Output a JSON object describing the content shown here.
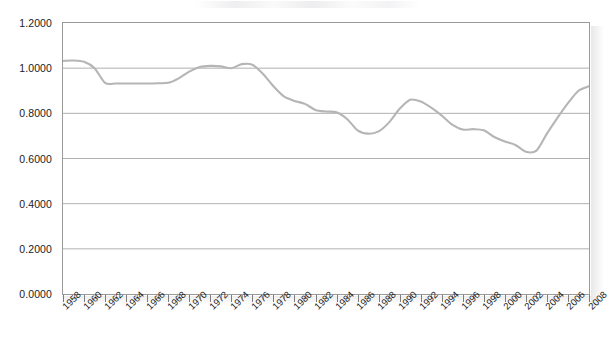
{
  "chart_data": {
    "type": "line",
    "title": "",
    "subtitle": "",
    "xlabel": "",
    "ylabel": "",
    "grid": true,
    "legend": "none",
    "ylim": [
      0.0,
      1.2
    ],
    "xlim": [
      1958,
      2008
    ],
    "ytick_labels": [
      "1.2000",
      "1.0000",
      "0.8000",
      "0.6000",
      "0.4000",
      "0.2000",
      "0.0000"
    ],
    "ytick_values": [
      1.2,
      1.0,
      0.8,
      0.6,
      0.4,
      0.2,
      0.0
    ],
    "xtick_labels": [
      "1958",
      "1960",
      "1962",
      "1964",
      "1966",
      "1968",
      "1970",
      "1972",
      "1974",
      "1976",
      "1978",
      "1980",
      "1982",
      "1984",
      "1986",
      "1988",
      "1990",
      "1992",
      "1994",
      "1996",
      "1998",
      "2000",
      "2002",
      "2004",
      "2006",
      "2008"
    ],
    "series": [
      {
        "name": "series-1",
        "color": "#b5b5b5",
        "x": [
          1958,
          1959,
          1960,
          1961,
          1962,
          1963,
          1964,
          1965,
          1966,
          1967,
          1968,
          1969,
          1970,
          1971,
          1972,
          1973,
          1974,
          1975,
          1976,
          1977,
          1978,
          1979,
          1980,
          1981,
          1982,
          1983,
          1984,
          1985,
          1986,
          1987,
          1988,
          1989,
          1990,
          1991,
          1992,
          1993,
          1994,
          1995,
          1996,
          1997,
          1998,
          1999,
          2000,
          2001,
          2002,
          2003,
          2004,
          2005,
          2006,
          2007,
          2008
        ],
        "values": [
          1.032,
          1.034,
          1.028,
          1.0,
          0.935,
          0.932,
          0.932,
          0.932,
          0.932,
          0.933,
          0.935,
          0.955,
          0.985,
          1.005,
          1.01,
          1.008,
          1.0,
          1.018,
          1.015,
          0.975,
          0.92,
          0.875,
          0.855,
          0.842,
          0.815,
          0.808,
          0.805,
          0.775,
          0.725,
          0.71,
          0.72,
          0.76,
          0.82,
          0.86,
          0.852,
          0.825,
          0.79,
          0.75,
          0.728,
          0.73,
          0.725,
          0.695,
          0.675,
          0.66,
          0.63,
          0.635,
          0.71,
          0.78,
          0.845,
          0.9,
          0.92
        ]
      }
    ]
  },
  "axis": {
    "y_labels": [
      "1.2000",
      "1.0000",
      "0.8000",
      "0.6000",
      "0.4000",
      "0.2000",
      "0.0000"
    ],
    "x_labels": [
      "1958",
      "1960",
      "1962",
      "1964",
      "1966",
      "1968",
      "1970",
      "1972",
      "1974",
      "1976",
      "1978",
      "1980",
      "1982",
      "1984",
      "1986",
      "1988",
      "1990",
      "1992",
      "1994",
      "1996",
      "1998",
      "2000",
      "2002",
      "2004",
      "2006",
      "2008"
    ]
  }
}
